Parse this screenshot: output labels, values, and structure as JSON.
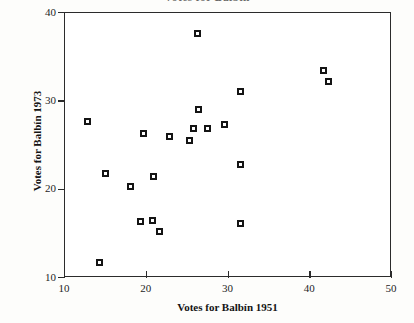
{
  "chart_data": {
    "type": "scatter",
    "title": "Votes for Balbín",
    "xlabel": "Votes for Balbín 1951",
    "ylabel": "Votes for Balbín 1973",
    "xlim": [
      10,
      50
    ],
    "ylim": [
      10,
      40
    ],
    "xticks": [
      10,
      20,
      30,
      40,
      50
    ],
    "yticks": [
      10,
      20,
      30,
      40
    ],
    "grid": false,
    "legend": null,
    "marker": "filled-square-open-center",
    "marker_color": "#141414",
    "n_points": 21,
    "points": [
      {
        "x": 12.9,
        "y": 27.6
      },
      {
        "x": 14.3,
        "y": 11.6
      },
      {
        "x": 15.1,
        "y": 21.7
      },
      {
        "x": 18.1,
        "y": 20.2
      },
      {
        "x": 19.3,
        "y": 16.3
      },
      {
        "x": 19.7,
        "y": 26.3
      },
      {
        "x": 20.8,
        "y": 16.4
      },
      {
        "x": 21.0,
        "y": 21.4
      },
      {
        "x": 21.7,
        "y": 15.2
      },
      {
        "x": 22.9,
        "y": 25.9
      },
      {
        "x": 25.3,
        "y": 25.5
      },
      {
        "x": 25.8,
        "y": 26.8
      },
      {
        "x": 26.3,
        "y": 37.6
      },
      {
        "x": 26.4,
        "y": 29.0
      },
      {
        "x": 27.6,
        "y": 26.8
      },
      {
        "x": 29.6,
        "y": 27.3
      },
      {
        "x": 31.6,
        "y": 31.0
      },
      {
        "x": 31.6,
        "y": 22.7
      },
      {
        "x": 31.6,
        "y": 16.1
      },
      {
        "x": 41.7,
        "y": 33.4
      },
      {
        "x": 42.3,
        "y": 32.1
      }
    ]
  },
  "axes": {
    "x_tick_labels": [
      "10",
      "20",
      "30",
      "40",
      "50"
    ],
    "y_tick_labels": [
      "10",
      "20",
      "30",
      "40"
    ]
  }
}
